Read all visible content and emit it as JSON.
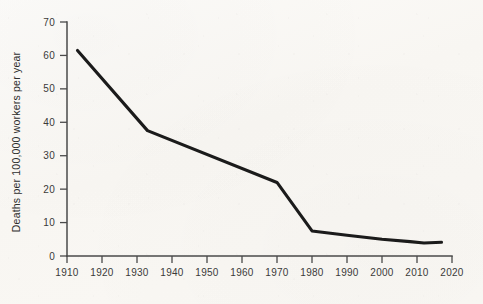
{
  "chart_data": {
    "type": "line",
    "title": "",
    "subtitle": "",
    "xlabel": "",
    "ylabel": "Deaths per 100,000 workers per year",
    "xlim": [
      1910,
      2020
    ],
    "ylim": [
      0,
      70
    ],
    "grid": false,
    "legend": "none",
    "x_ticks": [
      1910,
      1920,
      1930,
      1940,
      1950,
      1960,
      1970,
      1980,
      1990,
      2000,
      2010,
      2020
    ],
    "y_ticks": [
      0,
      10,
      20,
      30,
      40,
      50,
      60,
      70
    ],
    "x_tick_labels": [
      "1910",
      "1920",
      "1930",
      "1940",
      "1950",
      "1960",
      "1970",
      "1980",
      "1990",
      "2000",
      "2010",
      "2020"
    ],
    "y_tick_labels": [
      "0",
      "10",
      "20",
      "30",
      "40",
      "50",
      "60",
      "70"
    ],
    "line_color": "#1b1b1b",
    "background_color": "#fbfaf7",
    "axis_color": "#4a4a4a",
    "series": [
      {
        "name": "Workplace death rate",
        "x": [
          1913,
          1933,
          1970,
          1980,
          1990,
          2000,
          2008,
          2012,
          2017
        ],
        "values": [
          61.5,
          37.5,
          22.0,
          7.5,
          6.2,
          5.0,
          4.3,
          3.9,
          4.1
        ]
      }
    ],
    "points": [
      {
        "year": 1913,
        "value": 61.5
      },
      {
        "year": 1933,
        "value": 37.5
      },
      {
        "year": 1970,
        "value": 22.0
      },
      {
        "year": 1980,
        "value": 7.5
      },
      {
        "year": 1990,
        "value": 6.2
      },
      {
        "year": 2000,
        "value": 5.0
      },
      {
        "year": 2008,
        "value": 4.3
      },
      {
        "year": 2012,
        "value": 3.9
      },
      {
        "year": 2017,
        "value": 4.1
      }
    ]
  },
  "axes": {
    "y_title": "Deaths per 100,000 workers per year"
  }
}
